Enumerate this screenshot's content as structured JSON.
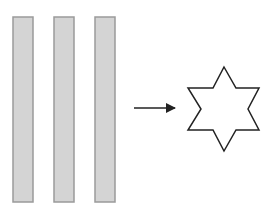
{
  "diagram": {
    "bars": [
      {
        "x": 13,
        "y": 17,
        "width": 20,
        "height": 185
      },
      {
        "x": 54,
        "y": 17,
        "width": 20,
        "height": 185
      },
      {
        "x": 95,
        "y": 17,
        "width": 20,
        "height": 185
      }
    ],
    "arrow": {
      "x1": 134,
      "y1": 108,
      "x2": 175,
      "y2": 108
    },
    "star": {
      "points": "224,67 236,88 259,88 248,109 259,130 236,130 224,151 213,130 188,130 201,109 188,88 213,88"
    },
    "colors": {
      "bar_fill": "#d4d4d4",
      "bar_stroke": "#9a9a9a",
      "arrow": "#222222",
      "star_stroke": "#222222",
      "star_fill": "#ffffff"
    }
  }
}
